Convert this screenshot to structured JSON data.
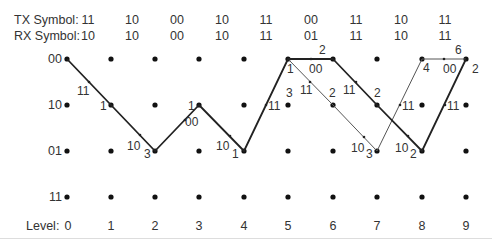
{
  "header": {
    "tx_label": "TX Symbol:",
    "rx_label": "RX Symbol:",
    "tx_symbols": [
      "11",
      "10",
      "00",
      "10",
      "11",
      "00",
      "11",
      "10",
      "11"
    ],
    "rx_symbols": [
      "10",
      "10",
      "00",
      "10",
      "11",
      "01",
      "11",
      "10",
      "11"
    ]
  },
  "states": [
    "00",
    "10",
    "01",
    "11"
  ],
  "levels": {
    "label": "Level:",
    "values": [
      "0",
      "1",
      "2",
      "3",
      "4",
      "5",
      "6",
      "7",
      "8",
      "9"
    ]
  },
  "trellis": {
    "survivor_path_color": "#222222",
    "alt_path_color": "#555555",
    "edges": [
      {
        "from": [
          0,
          "00"
        ],
        "to": [
          1,
          "10"
        ],
        "output": "11",
        "bold": true
      },
      {
        "from": [
          1,
          "10"
        ],
        "to": [
          2,
          "01"
        ],
        "output": "10",
        "bold": true
      },
      {
        "from": [
          2,
          "01"
        ],
        "to": [
          3,
          "10"
        ],
        "output": "00",
        "bold": true
      },
      {
        "from": [
          3,
          "10"
        ],
        "to": [
          4,
          "01"
        ],
        "output": "10",
        "bold": true
      },
      {
        "from": [
          4,
          "01"
        ],
        "to": [
          5,
          "00"
        ],
        "output": "11",
        "bold": true
      },
      {
        "from": [
          5,
          "00"
        ],
        "to": [
          6,
          "00"
        ],
        "output": "00",
        "bold": true
      },
      {
        "from": [
          5,
          "00"
        ],
        "to": [
          6,
          "10"
        ],
        "output": "11",
        "bold": false
      },
      {
        "from": [
          6,
          "00"
        ],
        "to": [
          7,
          "10"
        ],
        "output": "11",
        "bold": true
      },
      {
        "from": [
          6,
          "10"
        ],
        "to": [
          7,
          "01"
        ],
        "output": "10",
        "bold": false
      },
      {
        "from": [
          7,
          "10"
        ],
        "to": [
          8,
          "01"
        ],
        "output": "10",
        "bold": true
      },
      {
        "from": [
          7,
          "01"
        ],
        "to": [
          8,
          "00"
        ],
        "output": "11",
        "bold": false
      },
      {
        "from": [
          8,
          "01"
        ],
        "to": [
          9,
          "00"
        ],
        "output": "11",
        "bold": true
      },
      {
        "from": [
          8,
          "00"
        ],
        "to": [
          9,
          "00"
        ],
        "output": "00",
        "bold": false
      }
    ],
    "metrics": [
      {
        "level": 1,
        "state": "10",
        "value": "1"
      },
      {
        "level": 2,
        "state": "01",
        "value": "3"
      },
      {
        "level": 3,
        "state": "10",
        "value": "1"
      },
      {
        "level": 4,
        "state": "01",
        "value": "1"
      },
      {
        "level": 5,
        "state": "00",
        "value": "1"
      },
      {
        "level": 5,
        "state": "10",
        "value": "3"
      },
      {
        "level": 6,
        "state": "00",
        "value": "2"
      },
      {
        "level": 6,
        "state": "10",
        "value": "2"
      },
      {
        "level": 7,
        "state": "10",
        "value": "2"
      },
      {
        "level": 7,
        "state": "01",
        "value": "3"
      },
      {
        "level": 8,
        "state": "00",
        "value": "4"
      },
      {
        "level": 8,
        "state": "01",
        "value": "2"
      },
      {
        "level": 9,
        "state": "00",
        "value": "2"
      },
      {
        "level": 9,
        "state": "00_above",
        "value": "6"
      }
    ],
    "edge_labels": [
      "11",
      "10",
      "00",
      "10",
      "11",
      "00",
      "11",
      "11",
      "10",
      "10",
      "11",
      "11",
      "00"
    ],
    "metric_labels": [
      "1",
      "3",
      "1",
      "1",
      "1",
      "3",
      "2",
      "2",
      "2",
      "3",
      "4",
      "2",
      "2",
      "6"
    ]
  }
}
